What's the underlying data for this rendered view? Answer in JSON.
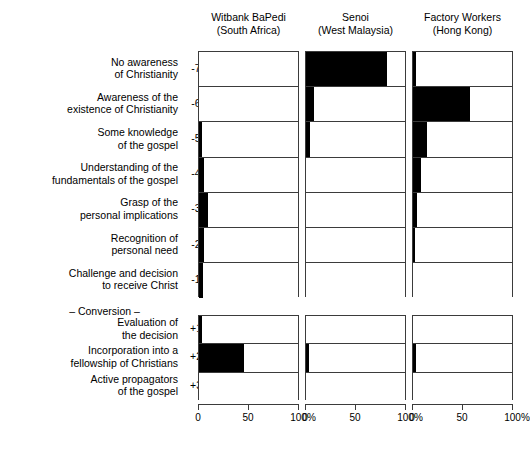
{
  "columns": [
    {
      "name": "Witbank BaPedi",
      "region": "(South Africa)"
    },
    {
      "name": "Senoi",
      "region": "(West Malaysia)"
    },
    {
      "name": "Factory Workers",
      "region": "(Hong Kong)"
    }
  ],
  "rows": [
    {
      "tick": "-7",
      "l1": "No awareness",
      "l2": "of Christianity"
    },
    {
      "tick": "-6",
      "l1": "Awareness of the",
      "l2": "existence of Christianity"
    },
    {
      "tick": "-5",
      "l1": "Some knowledge",
      "l2": "of the gospel"
    },
    {
      "tick": "-4",
      "l1": "Understanding of the",
      "l2": "fundamentals of the gospel"
    },
    {
      "tick": "-3",
      "l1": "Grasp of the",
      "l2": "personal implications"
    },
    {
      "tick": "-2",
      "l1": "Recognition of",
      "l2": "personal need"
    },
    {
      "tick": "-1",
      "l1": "Challenge and decision",
      "l2": "to receive Christ"
    }
  ],
  "conversion": "– Conversion –",
  "rows_post": [
    {
      "tick": "+1",
      "l1": "Evaluation of",
      "l2": "the decision"
    },
    {
      "tick": "+2",
      "l1": "Incorporation into a",
      "l2": "fellowship of Christians"
    },
    {
      "tick": "+3",
      "l1": "Active propagators",
      "l2": "of the gospel"
    }
  ],
  "axis": {
    "ticks": [
      "0",
      "50",
      "100%"
    ],
    "tick_values": [
      0,
      50,
      100
    ]
  },
  "chart_data": {
    "type": "bar",
    "title": "",
    "xlabel": "",
    "ylabel": "",
    "xlim": [
      0,
      100
    ],
    "grid": false,
    "orientation": "horizontal",
    "legend": "none",
    "categories": [
      "-7",
      "-6",
      "-5",
      "-4",
      "-3",
      "-2",
      "-1",
      "+1",
      "+2",
      "+3"
    ],
    "category_labels": [
      "No awareness of Christianity",
      "Awareness of the existence of Christianity",
      "Some knowledge of the gospel",
      "Understanding of the fundamentals of the gospel",
      "Grasp of the personal implications",
      "Recognition of personal need",
      "Challenge and decision to receive Christ",
      "Evaluation of the decision",
      "Incorporation into a fellowship of Christians",
      "Active propagators of the gospel"
    ],
    "series": [
      {
        "name": "Witbank BaPedi (South Africa)",
        "values": [
          0,
          0,
          3,
          5,
          9,
          5,
          4,
          3,
          45,
          0
        ]
      },
      {
        "name": "Senoi (West Malaysia)",
        "values": [
          82,
          8,
          4,
          0,
          0,
          0,
          0,
          0,
          3,
          0
        ]
      },
      {
        "name": "Factory Workers (Hong Kong)",
        "values": [
          3,
          58,
          14,
          8,
          4,
          2,
          0,
          0,
          3,
          0
        ]
      }
    ]
  }
}
